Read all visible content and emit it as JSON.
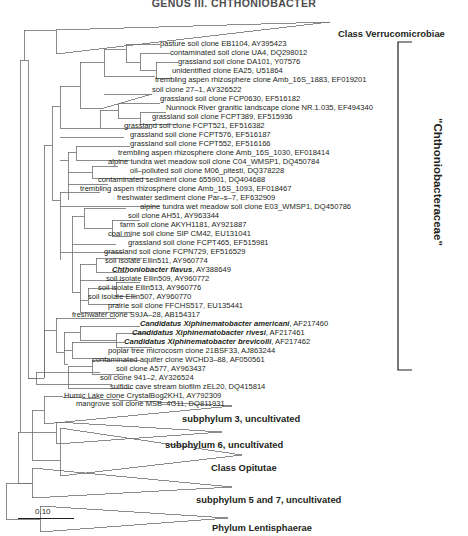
{
  "figure": {
    "header": "GENUS III. CHTHONIOBACTER",
    "scale_bar_label": "0.10",
    "bracket_label": "\"Chthoniobacteraceae\"",
    "tree_type": "phylogram"
  },
  "tips": [
    {
      "name": "pasture soil clone EB1104",
      "accession": "AY395423",
      "italic": false
    },
    {
      "name": "contaminated soil clone UA4",
      "accession": "DQ298012",
      "italic": false
    },
    {
      "name": "grassland soil clone DA101",
      "accession": "Y07576",
      "italic": false
    },
    {
      "name": "unidentified clone EA25",
      "accession": "U51864",
      "italic": false
    },
    {
      "name": "trembling aspen rhizosphere clone Amb_16S_1883",
      "accession": "EF019201",
      "italic": false
    },
    {
      "name": "soil clone 27–1",
      "accession": "AY326522",
      "italic": false
    },
    {
      "name": "grassland soil clone FCP0630",
      "accession": "EF516182",
      "italic": false
    },
    {
      "name": "Nunnock River granitic landscape clone NR.1.035",
      "accession": "EF494340",
      "italic": false
    },
    {
      "name": "grassland soil clone FCPT389",
      "accession": "EF515936",
      "italic": false
    },
    {
      "name": "grassland soil clone FCPT521",
      "accession": "EF516382",
      "italic": false
    },
    {
      "name": "grassland soil clone FCPT576",
      "accession": "EF516187",
      "italic": false
    },
    {
      "name": "grassland soil clone FCPT552",
      "accession": "EF516166",
      "italic": false
    },
    {
      "name": "trembling aspen rhizosphere clone Amb_16S_1030",
      "accession": "EF018414",
      "italic": false
    },
    {
      "name": "alpine tundra wet meadow soil clone C04_WMSP1",
      "accession": "DQ450784",
      "italic": false
    },
    {
      "name": "oil–polluted soil clone M06_pitesti",
      "accession": "DQ378228",
      "italic": false
    },
    {
      "name": "contaminated sediment clone 655901",
      "accession": "DQ404688",
      "italic": false
    },
    {
      "name": "trembling aspen rhizosphere clone Amb_16S_1093",
      "accession": "EF018467",
      "italic": false
    },
    {
      "name": "freshwater sediment clone Par–s–7",
      "accession": "EF632909",
      "italic": false
    },
    {
      "name": "alpine tundra wet meadow soil clone E03_WMSP1",
      "accession": "DQ450786",
      "italic": false
    },
    {
      "name": "soil clone AH51",
      "accession": "AY963344",
      "italic": false
    },
    {
      "name": "farm soil clone AKYH1181",
      "accession": "AY921887",
      "italic": false
    },
    {
      "name": "coal mine soil clone SIP CM42",
      "accession": "EU131041",
      "italic": false
    },
    {
      "name": "grassland soil clone FCPT465",
      "accession": "EF515981",
      "italic": false
    },
    {
      "name": "grassland soil clone FCPN729",
      "accession": "EF516529",
      "italic": false
    },
    {
      "name": "soil isolate Ellin511",
      "accession": "AY960774",
      "italic": false
    },
    {
      "name": "Chthoniobacter flavus",
      "accession": "AY388649",
      "italic": true
    },
    {
      "name": "soil isolate Ellin509",
      "accession": "AY960772",
      "italic": false
    },
    {
      "name": "soil isolate Ellin513",
      "accession": "AY960776",
      "italic": false
    },
    {
      "name": "soil isolate Ellin507",
      "accession": "AY960770",
      "italic": false
    },
    {
      "name": "prairie soil clone FFCHS517",
      "accession": "EU135441",
      "italic": false
    },
    {
      "name": "freshwater clone S9JA–28",
      "accession": "AB154317",
      "italic": false
    },
    {
      "name": "Candidatus Xiphinematobacter americani",
      "accession": "AF217460",
      "italic": true
    },
    {
      "name": "Candidatus Xiphinematobacter rivesi",
      "accession": "AF217461",
      "italic": true
    },
    {
      "name": "Candidatus Xiphinematobacter brevicolli",
      "accession": "AF217462",
      "italic": true
    },
    {
      "name": "poplar tree microcosm clone 21BSF33",
      "accession": "AJ863244",
      "italic": false
    },
    {
      "name": "contaminated aquifer clone WCHD3–88",
      "accession": "AF050561",
      "italic": false
    },
    {
      "name": "soil clone A577",
      "accession": "AY963437",
      "italic": false
    },
    {
      "name": "soil clone 941–2",
      "accession": "AY326524",
      "italic": false
    },
    {
      "name": "sulfidic cave stream biofilm zEL20",
      "accession": "DQ415814",
      "italic": false
    },
    {
      "name": "Humic Lake clone CrystalBog2KH1",
      "accession": "AY792309",
      "italic": false
    },
    {
      "name": "mangrove soil clone MSB–4G11",
      "accession": "DQ811931",
      "italic": false
    }
  ],
  "clades": [
    {
      "label": "Class Verrucomicrobiae"
    },
    {
      "label": "subphylum 3, uncultivated"
    },
    {
      "label": "subphylum 6, uncultivated"
    },
    {
      "label": "Class Opitutae"
    },
    {
      "label": "subphylum 5 and 7, uncultivated"
    },
    {
      "label": "Phylum Lentisphaerae"
    }
  ],
  "colors": {
    "line": "#6d6e71",
    "text": "#231f20",
    "background": "#ffffff"
  }
}
